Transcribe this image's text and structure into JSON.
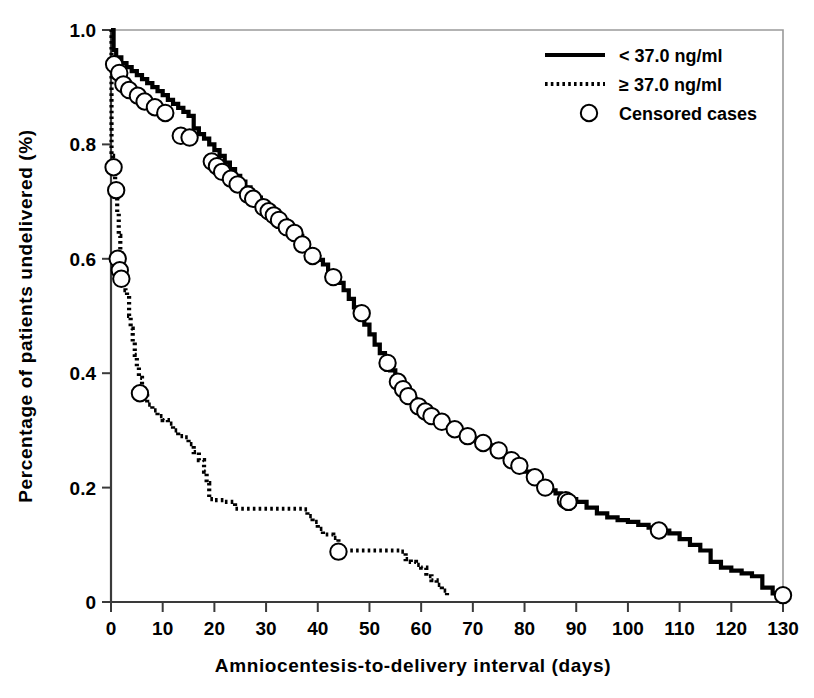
{
  "chart_data": {
    "type": "line",
    "title": "",
    "subtitle": "",
    "xlabel": "Amniocentesis-to-delivery interval (days)",
    "ylabel": "Percentage of patients undelivered (%)",
    "xlim": [
      0,
      130
    ],
    "ylim": [
      0,
      1.0
    ],
    "xticks": [
      0,
      10,
      20,
      30,
      40,
      50,
      60,
      70,
      80,
      90,
      100,
      110,
      120,
      130
    ],
    "xticklabels": [
      "0",
      "10",
      "20",
      "30",
      "40",
      "50",
      "60",
      "70",
      "80",
      "90",
      "100",
      "110",
      "120",
      "130"
    ],
    "yticks": [
      0,
      0.2,
      0.4,
      0.6,
      0.8,
      1.0
    ],
    "yticklabels": [
      "0",
      "0.2",
      "0.4",
      "0.6",
      "0.8",
      "1.0"
    ],
    "grid": false,
    "legend_position": "top-right",
    "series": [
      {
        "name": "< 37.0 ng/ml",
        "style": "solid",
        "color": "#000000",
        "points": [
          [
            0,
            1.0
          ],
          [
            0.5,
            0.965
          ],
          [
            1,
            0.952
          ],
          [
            2,
            0.942
          ],
          [
            3,
            0.935
          ],
          [
            4,
            0.928
          ],
          [
            5,
            0.921
          ],
          [
            6,
            0.914
          ],
          [
            7,
            0.907
          ],
          [
            8,
            0.9
          ],
          [
            9,
            0.893
          ],
          [
            10,
            0.886
          ],
          [
            11,
            0.878
          ],
          [
            12,
            0.871
          ],
          [
            13,
            0.864
          ],
          [
            14,
            0.857
          ],
          [
            15,
            0.85
          ],
          [
            16,
            0.828
          ],
          [
            17,
            0.818
          ],
          [
            18,
            0.81
          ],
          [
            19,
            0.8
          ],
          [
            20,
            0.79
          ],
          [
            21,
            0.78
          ],
          [
            22,
            0.768
          ],
          [
            23,
            0.757
          ],
          [
            24,
            0.745
          ],
          [
            25,
            0.735
          ],
          [
            26,
            0.725
          ],
          [
            27,
            0.715
          ],
          [
            28,
            0.707
          ],
          [
            29,
            0.7
          ],
          [
            30,
            0.692
          ],
          [
            31,
            0.684
          ],
          [
            32,
            0.676
          ],
          [
            33,
            0.668
          ],
          [
            34,
            0.66
          ],
          [
            35,
            0.65
          ],
          [
            36,
            0.64
          ],
          [
            37,
            0.628
          ],
          [
            38,
            0.617
          ],
          [
            39,
            0.607
          ],
          [
            40,
            0.598
          ],
          [
            41,
            0.59
          ],
          [
            42,
            0.578
          ],
          [
            43,
            0.568
          ],
          [
            44,
            0.558
          ],
          [
            45,
            0.545
          ],
          [
            46,
            0.53
          ],
          [
            47,
            0.515
          ],
          [
            48,
            0.5
          ],
          [
            49,
            0.485
          ],
          [
            50,
            0.468
          ],
          [
            51,
            0.45
          ],
          [
            52,
            0.435
          ],
          [
            53,
            0.42
          ],
          [
            54,
            0.405
          ],
          [
            55,
            0.39
          ],
          [
            56,
            0.378
          ],
          [
            57,
            0.366
          ],
          [
            58,
            0.355
          ],
          [
            59,
            0.345
          ],
          [
            60,
            0.336
          ],
          [
            61,
            0.33
          ],
          [
            62,
            0.325
          ],
          [
            63,
            0.32
          ],
          [
            64,
            0.315
          ],
          [
            65,
            0.31
          ],
          [
            66,
            0.305
          ],
          [
            67,
            0.3
          ],
          [
            68,
            0.295
          ],
          [
            69,
            0.29
          ],
          [
            70,
            0.285
          ],
          [
            71,
            0.28
          ],
          [
            72,
            0.277
          ],
          [
            73,
            0.274
          ],
          [
            74,
            0.27
          ],
          [
            75,
            0.265
          ],
          [
            76,
            0.258
          ],
          [
            77,
            0.25
          ],
          [
            78,
            0.242
          ],
          [
            79,
            0.235
          ],
          [
            80,
            0.228
          ],
          [
            81,
            0.222
          ],
          [
            82,
            0.215
          ],
          [
            83,
            0.208
          ],
          [
            84,
            0.2
          ],
          [
            85,
            0.195
          ],
          [
            86,
            0.19
          ],
          [
            87,
            0.185
          ],
          [
            88,
            0.18
          ],
          [
            90,
            0.175
          ],
          [
            92,
            0.165
          ],
          [
            94,
            0.155
          ],
          [
            96,
            0.148
          ],
          [
            98,
            0.143
          ],
          [
            100,
            0.14
          ],
          [
            102,
            0.135
          ],
          [
            104,
            0.13
          ],
          [
            106,
            0.125
          ],
          [
            108,
            0.12
          ],
          [
            110,
            0.11
          ],
          [
            112,
            0.1
          ],
          [
            114,
            0.09
          ],
          [
            116,
            0.07
          ],
          [
            118,
            0.06
          ],
          [
            120,
            0.055
          ],
          [
            122,
            0.05
          ],
          [
            124,
            0.045
          ],
          [
            126,
            0.025
          ],
          [
            128,
            0.015
          ],
          [
            130,
            0.012
          ]
        ],
        "censored": [
          [
            0.6,
            0.94
          ],
          [
            1.6,
            0.925
          ],
          [
            2.4,
            0.905
          ],
          [
            3.5,
            0.895
          ],
          [
            5.2,
            0.885
          ],
          [
            6.5,
            0.875
          ],
          [
            8.5,
            0.865
          ],
          [
            10.5,
            0.855
          ],
          [
            13.5,
            0.815
          ],
          [
            15.2,
            0.812
          ],
          [
            19.5,
            0.77
          ],
          [
            20.5,
            0.762
          ],
          [
            21.5,
            0.752
          ],
          [
            23.2,
            0.74
          ],
          [
            24.5,
            0.73
          ],
          [
            26.5,
            0.712
          ],
          [
            27.5,
            0.705
          ],
          [
            29.5,
            0.69
          ],
          [
            30.5,
            0.683
          ],
          [
            31.5,
            0.676
          ],
          [
            32.5,
            0.668
          ],
          [
            34,
            0.655
          ],
          [
            35.5,
            0.645
          ],
          [
            37,
            0.625
          ],
          [
            39,
            0.605
          ],
          [
            43,
            0.568
          ],
          [
            48.5,
            0.505
          ],
          [
            53.5,
            0.418
          ],
          [
            55.5,
            0.385
          ],
          [
            56.5,
            0.372
          ],
          [
            57.5,
            0.36
          ],
          [
            59.5,
            0.342
          ],
          [
            60.8,
            0.333
          ],
          [
            62,
            0.325
          ],
          [
            64,
            0.315
          ],
          [
            66.5,
            0.302
          ],
          [
            69,
            0.29
          ],
          [
            72,
            0.278
          ],
          [
            75,
            0.265
          ],
          [
            77.5,
            0.248
          ],
          [
            79,
            0.238
          ],
          [
            82,
            0.218
          ],
          [
            84,
            0.2
          ],
          [
            88,
            0.178
          ],
          [
            88.5,
            0.175
          ],
          [
            106,
            0.125
          ],
          [
            130,
            0.012
          ]
        ]
      },
      {
        "name": "≥ 37.0 ng/ml",
        "style": "dotted",
        "color": "#000000",
        "points": [
          [
            0,
            1.0
          ],
          [
            0.1,
            0.78
          ],
          [
            0.4,
            0.76
          ],
          [
            0.8,
            0.72
          ],
          [
            1.2,
            0.68
          ],
          [
            1.5,
            0.64
          ],
          [
            1.8,
            0.61
          ],
          [
            2.0,
            0.6
          ],
          [
            2.2,
            0.575
          ],
          [
            2.5,
            0.555
          ],
          [
            2.8,
            0.545
          ],
          [
            3.1,
            0.535
          ],
          [
            3.5,
            0.5
          ],
          [
            3.8,
            0.478
          ],
          [
            4.2,
            0.455
          ],
          [
            4.6,
            0.432
          ],
          [
            5.0,
            0.41
          ],
          [
            5.4,
            0.392
          ],
          [
            6.0,
            0.365
          ],
          [
            7,
            0.345
          ],
          [
            8,
            0.335
          ],
          [
            9,
            0.325
          ],
          [
            10,
            0.318
          ],
          [
            11,
            0.312
          ],
          [
            12,
            0.3
          ],
          [
            13,
            0.29
          ],
          [
            14,
            0.288
          ],
          [
            15,
            0.276
          ],
          [
            16,
            0.262
          ],
          [
            17,
            0.248
          ],
          [
            18,
            0.228
          ],
          [
            18.5,
            0.208
          ],
          [
            19,
            0.18
          ],
          [
            20,
            0.178
          ],
          [
            22,
            0.175
          ],
          [
            24,
            0.163
          ],
          [
            30,
            0.163
          ],
          [
            36,
            0.163
          ],
          [
            37,
            0.162
          ],
          [
            38,
            0.15
          ],
          [
            39,
            0.14
          ],
          [
            40,
            0.128
          ],
          [
            41,
            0.118
          ],
          [
            43,
            0.112
          ],
          [
            44,
            0.09
          ],
          [
            50,
            0.09
          ],
          [
            55,
            0.09
          ],
          [
            56,
            0.088
          ],
          [
            57,
            0.075
          ],
          [
            58,
            0.07
          ],
          [
            59,
            0.065
          ],
          [
            60,
            0.06
          ],
          [
            61,
            0.045
          ],
          [
            62,
            0.038
          ],
          [
            63,
            0.03
          ],
          [
            64,
            0.02
          ],
          [
            65,
            0.012
          ]
        ],
        "censored": [
          [
            0.5,
            0.76
          ],
          [
            1.0,
            0.72
          ],
          [
            1.3,
            0.6
          ],
          [
            1.7,
            0.58
          ],
          [
            2.0,
            0.565
          ],
          [
            5.6,
            0.365
          ],
          [
            44,
            0.088
          ]
        ]
      }
    ],
    "legend_entries": [
      {
        "label": "< 37.0 ng/ml",
        "marker": "solid-line"
      },
      {
        "label": "≥ 37.0 ng/ml",
        "marker": "dotted-line"
      },
      {
        "label": "Censored cases",
        "marker": "open-circle"
      }
    ]
  },
  "figure": {
    "background_color": "#ffffff",
    "line_color": "#000000",
    "axis_color": "#3a3a3a",
    "frame_color": "#9a9a9a"
  }
}
